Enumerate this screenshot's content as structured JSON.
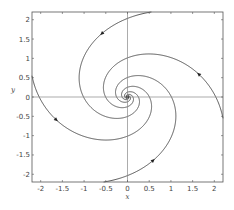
{
  "chart_data": {
    "type": "line",
    "title": "",
    "subtitle": "",
    "xlabel": "x",
    "ylabel": "y",
    "xlim": [
      -2.2,
      2.2
    ],
    "ylim": [
      -2.2,
      2.2
    ],
    "xticks": [
      -2,
      -1.5,
      -1,
      -0.5,
      0,
      0.5,
      1,
      1.5,
      2
    ],
    "yticks": [
      -2,
      -1.5,
      -1,
      -0.5,
      0,
      0.5,
      1,
      1.5,
      2
    ],
    "xtick_labels": [
      "-2",
      "-1.5",
      "-1",
      "-0.5",
      "0",
      "0.5",
      "1",
      "1.5",
      "2"
    ],
    "ytick_labels": [
      "-2",
      "-1.5",
      "-1",
      "-0.5",
      "0",
      "0.5",
      "1",
      "1.5",
      "2"
    ],
    "grid": false,
    "legend": null,
    "system": {
      "a": 0.45,
      "dx": "-a*x - y",
      "dy": "x - a*y"
    },
    "series": [
      {
        "name": "trajectory-1",
        "start": [
          0.55,
          2.2
        ],
        "arrow_at": [
          -0.45,
          1.5
        ]
      },
      {
        "name": "trajectory-2",
        "start": [
          -2.2,
          0.55
        ],
        "arrow_at": [
          -1.5,
          -0.45
        ]
      },
      {
        "name": "trajectory-3",
        "start": [
          -0.55,
          -2.2
        ],
        "arrow_at": [
          0.45,
          -1.5
        ]
      },
      {
        "name": "trajectory-4",
        "start": [
          2.2,
          -0.55
        ],
        "arrow_at": [
          1.5,
          0.45
        ]
      }
    ],
    "reference_lines": [
      {
        "type": "vertical",
        "x": 0
      },
      {
        "type": "horizontal",
        "y": 0
      }
    ]
  }
}
